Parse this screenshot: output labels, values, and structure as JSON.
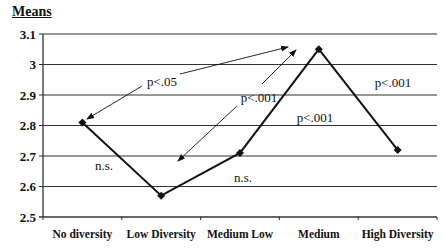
{
  "chart_data": {
    "type": "line",
    "title": "Means",
    "xlabel": "",
    "ylabel": "Means",
    "categories": [
      "No diversity",
      "Low Diversity",
      "Medium Low",
      "Medium",
      "High Diversity"
    ],
    "values": [
      2.81,
      2.57,
      2.71,
      3.05,
      2.72
    ],
    "ylim": [
      2.5,
      3.1
    ],
    "yticks": [
      "3.1",
      "3",
      "2.9",
      "2.8",
      "2.7",
      "2.6",
      "2.5"
    ],
    "grid": true,
    "legend": null,
    "annotations": [
      {
        "text": "p<.05",
        "between": [
          "No diversity",
          "Medium"
        ],
        "kind": "double-arrow"
      },
      {
        "text": "p<.001",
        "between": [
          "Low Diversity",
          "Medium"
        ],
        "kind": "double-arrow"
      },
      {
        "text": "n.s.",
        "segment": [
          "No diversity",
          "Low Diversity"
        ]
      },
      {
        "text": "n.s.",
        "segment": [
          "Low Diversity",
          "Medium Low"
        ]
      },
      {
        "text": "p<.001",
        "segment": [
          "Medium Low",
          "Medium"
        ]
      },
      {
        "text": "p<.001",
        "segment": [
          "Medium",
          "High Diversity"
        ]
      }
    ]
  }
}
